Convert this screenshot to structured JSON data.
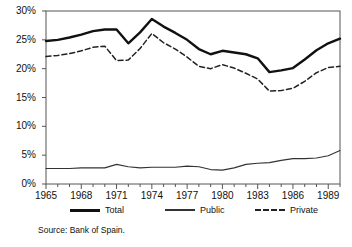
{
  "chart_data": {
    "type": "line",
    "title": "",
    "subtitle": "",
    "xlabel": "",
    "ylabel": "",
    "xlim": [
      1965,
      1990
    ],
    "ylim": [
      0,
      30
    ],
    "grid": false,
    "legend_position": "bottom",
    "source_note": "Source: Bank of Spain.",
    "x": [
      1965,
      1966,
      1967,
      1968,
      1969,
      1970,
      1971,
      1972,
      1973,
      1974,
      1975,
      1976,
      1977,
      1978,
      1979,
      1980,
      1981,
      1982,
      1983,
      1984,
      1985,
      1986,
      1987,
      1988,
      1989,
      1990
    ],
    "y_ticks": [
      0,
      5,
      10,
      15,
      20,
      25,
      30
    ],
    "y_tick_labels": [
      "0%",
      "5%",
      "10%",
      "15%",
      "20%",
      "25%",
      "30%"
    ],
    "x_ticks": [
      1965,
      1968,
      1971,
      1974,
      1977,
      1980,
      1983,
      1986,
      1989
    ],
    "x_tick_labels": [
      "1965",
      "1968",
      "1971",
      "1974",
      "1977",
      "1980",
      "1983",
      "1986",
      "1989"
    ],
    "series": [
      {
        "name": "Total",
        "style": "solid-thick",
        "color": "#111111",
        "values": [
          24.8,
          25.0,
          25.4,
          25.9,
          26.5,
          26.8,
          26.8,
          24.4,
          26.3,
          28.6,
          27.3,
          26.2,
          25.0,
          23.4,
          22.5,
          23.1,
          22.8,
          22.5,
          21.8,
          19.4,
          19.7,
          20.1,
          21.6,
          23.2,
          24.4,
          25.2
        ]
      },
      {
        "name": "Public",
        "style": "solid-thin",
        "color": "#333333",
        "values": [
          2.7,
          2.7,
          2.7,
          2.8,
          2.8,
          2.8,
          3.4,
          3.0,
          2.8,
          2.9,
          2.9,
          2.9,
          3.1,
          3.0,
          2.5,
          2.4,
          2.8,
          3.4,
          3.6,
          3.7,
          4.1,
          4.4,
          4.4,
          4.5,
          4.9,
          5.8
        ]
      },
      {
        "name": "Private",
        "style": "dashed",
        "color": "#222222",
        "values": [
          22.1,
          22.3,
          22.6,
          23.1,
          23.7,
          23.9,
          21.4,
          21.5,
          23.5,
          26.1,
          24.5,
          23.4,
          22.0,
          20.4,
          20.0,
          20.7,
          20.1,
          19.2,
          18.2,
          16.1,
          16.2,
          16.6,
          17.8,
          19.3,
          20.2,
          20.4
        ]
      }
    ]
  },
  "legend": {
    "items": [
      {
        "label": "Total"
      },
      {
        "label": "Public"
      },
      {
        "label": "Private"
      }
    ]
  },
  "axes": {
    "y_tick_labels": [
      "30%",
      "25%",
      "20%",
      "15%",
      "10%",
      "5%",
      "0%"
    ],
    "x_tick_labels": [
      "1965",
      "1968",
      "1971",
      "1974",
      "1977",
      "1980",
      "1983",
      "1986",
      "1989"
    ]
  },
  "footer": {
    "source": "Source: Bank of Spain."
  }
}
